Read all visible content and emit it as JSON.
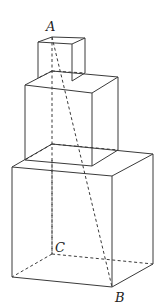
{
  "diagram": {
    "type": "stacked-cubes",
    "labels": {
      "A": "A",
      "B": "B",
      "C": "C"
    },
    "cubes": [
      {
        "name": "top-cube",
        "size": "small"
      },
      {
        "name": "middle-cube",
        "size": "medium"
      },
      {
        "name": "bottom-cube",
        "size": "large"
      }
    ],
    "segments": [
      {
        "from": "A",
        "to": "B",
        "style": "dashed"
      },
      {
        "from": "A",
        "to": "C",
        "style": "dashed"
      },
      {
        "from": "C",
        "to": "B",
        "style": "dashed"
      }
    ],
    "colors": {
      "line": "#3a3a3a",
      "background": "#ffffff"
    }
  }
}
